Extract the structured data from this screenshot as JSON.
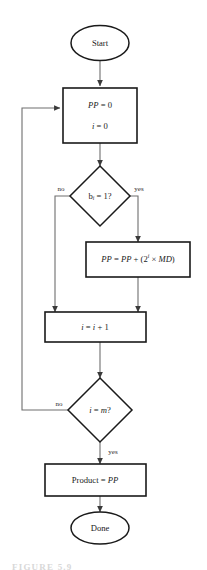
{
  "diagram": {
    "type": "flowchart",
    "colors": {
      "shape_stroke": "#1a1a1a",
      "shape_fill": "#ffffff",
      "edge": "#6e6e6e",
      "text": "#1a1a1a",
      "background": "#ffffff"
    },
    "nodes": {
      "start": {
        "shape": "ellipse",
        "label": "Start"
      },
      "init": {
        "shape": "process",
        "line1": "PP = 0",
        "line2": "i = 0",
        "line1_var": "PP",
        "line1_rest": " = 0",
        "line2_var": "i",
        "line2_rest": " = 0"
      },
      "decision_bit": {
        "shape": "decision",
        "label_var": "b",
        "label_sub": "i",
        "label_rest": " = 1?",
        "label": "b i = 1?",
        "branch_no": "no",
        "branch_yes": "yes"
      },
      "accumulate": {
        "shape": "process",
        "label": "PP = PP + (2 i × MD)",
        "part1": "PP",
        "part2": " = ",
        "part3": "PP",
        "part4": " + (2",
        "exponent": "i",
        "part5": " × ",
        "part6": "MD",
        "part7": ")"
      },
      "increment": {
        "shape": "process",
        "label": "i = i + 1",
        "var1": "i",
        "mid": " = ",
        "var2": "i",
        "rest": " + 1"
      },
      "decision_done": {
        "shape": "decision",
        "label": "i = m?",
        "var1": "i",
        "mid": " = ",
        "var2": "m",
        "rest": "?",
        "branch_no": "no",
        "branch_yes": "yes"
      },
      "result": {
        "shape": "process",
        "label": "Product = PP",
        "text": "Product = ",
        "var": "PP"
      },
      "done": {
        "shape": "ellipse",
        "label": "Done"
      }
    },
    "edges": [
      {
        "from": "start",
        "to": "init",
        "label": ""
      },
      {
        "from": "init",
        "to": "decision_bit",
        "label": ""
      },
      {
        "from": "decision_bit",
        "to": "increment",
        "label": "no"
      },
      {
        "from": "decision_bit",
        "to": "accumulate",
        "label": "yes"
      },
      {
        "from": "accumulate",
        "to": "increment",
        "label": ""
      },
      {
        "from": "increment",
        "to": "decision_done",
        "label": ""
      },
      {
        "from": "decision_done",
        "to": "init",
        "label": "no"
      },
      {
        "from": "decision_done",
        "to": "result",
        "label": "yes"
      },
      {
        "from": "result",
        "to": "done",
        "label": ""
      }
    ]
  },
  "caption": {
    "text": "FIGURE 5.9"
  }
}
